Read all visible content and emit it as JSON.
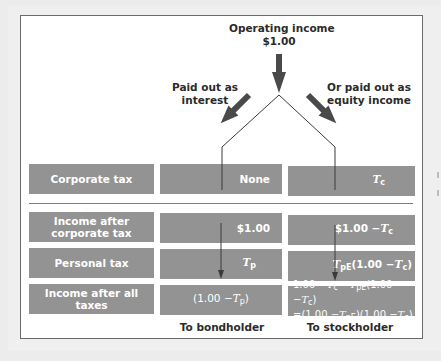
{
  "diagram": {
    "title_top": {
      "line1": "Operating income",
      "line2": "$1.00"
    },
    "branch_left": {
      "line1": "Paid out as",
      "line2": "interest"
    },
    "branch_right": {
      "line1": "Or paid out as",
      "line2": "equity income"
    },
    "rows": [
      {
        "label": "Corporate tax",
        "bond": "None",
        "stock": {
          "T": "T",
          "sub": "c"
        }
      },
      {
        "label_line1": "Income after",
        "label_line2": "corporate tax",
        "bond": "$1.00",
        "stock": {
          "prefix": "$1.00 −",
          "T": "T",
          "sub": "c"
        }
      },
      {
        "label": "Personal tax",
        "bond": {
          "T": "T",
          "sub": "p"
        },
        "stock": {
          "T": "T",
          "sub": "pE",
          "suffix_open": "(1.00 −",
          "T2": "T",
          "sub2": "c",
          "suffix_close": ")"
        }
      },
      {
        "label": "Income after all taxes",
        "bond": {
          "prefix": "(1.00 −",
          "T": "T",
          "sub": "p",
          "suffix": ")"
        },
        "stock_line1": {
          "a": "1.00 −",
          "T1": "T",
          "s1": "c",
          "b": " −",
          "T2": "T",
          "s2": "pE",
          "c": "(1.00 −",
          "T3": "T",
          "s3": "c",
          "d": ")"
        },
        "stock_line2": {
          "a": "=(1.00 −",
          "T1": "T",
          "s1": "pE",
          "b": ")(1.00 −",
          "T2": "T",
          "s2": "c",
          "c": ")"
        }
      }
    ],
    "footer": {
      "bond": "To bondholder",
      "stock": "To stockholder"
    },
    "colors": {
      "box_fill": "#939393",
      "box_text": "#ffffff",
      "arrow": "#4a4a4a",
      "line": "#3a3a3a",
      "frame": "#6b6b6b",
      "background": "#efefef"
    }
  }
}
